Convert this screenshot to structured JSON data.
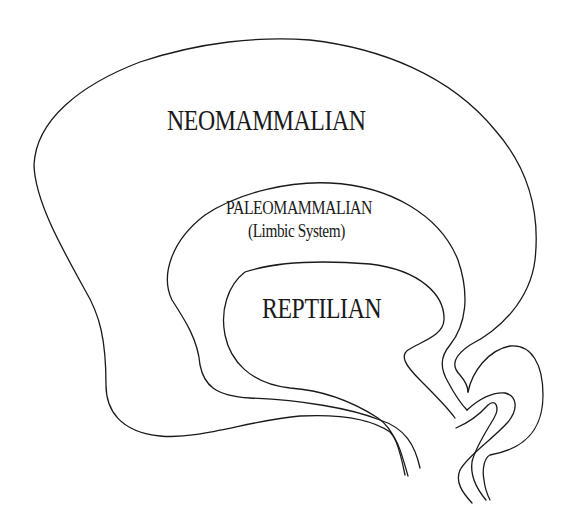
{
  "diagram": {
    "regions": [
      {
        "id": "neomammalian",
        "label": "NEOMAMMALIAN",
        "sublabel": ""
      },
      {
        "id": "paleomammalian",
        "label": "PALEOMAMMALIAN",
        "sublabel": "(Limbic System)"
      },
      {
        "id": "reptilian",
        "label": "REPTILIAN",
        "sublabel": ""
      }
    ],
    "stroke_color": "#1a1a1a",
    "background_color": "#ffffff"
  }
}
